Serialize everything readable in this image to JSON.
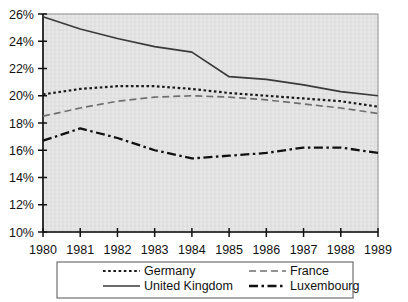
{
  "chart_data": {
    "type": "line",
    "title": "",
    "subtitle": "",
    "xlabel": "",
    "ylabel": "",
    "x": [
      1980,
      1981,
      1982,
      1983,
      1984,
      1985,
      1986,
      1987,
      1988,
      1989
    ],
    "xtick_labels": [
      "1980",
      "1981",
      "1982",
      "1983",
      "1984",
      "1985",
      "1986",
      "1987",
      "1988",
      "1989"
    ],
    "ytick_labels": [
      "10%",
      "12%",
      "14%",
      "16%",
      "18%",
      "20%",
      "22%",
      "24%",
      "26%"
    ],
    "ytick_values": [
      10,
      12,
      14,
      16,
      18,
      20,
      22,
      24,
      26
    ],
    "ylim": [
      10,
      26
    ],
    "xlim": [
      1980,
      1989
    ],
    "yunit": "%",
    "grid": true,
    "legend_position": "bottom",
    "plot_background": "#e8e8e8",
    "series": [
      {
        "name": "Germany",
        "dash": "dotted",
        "color": "#1a1a1a",
        "values": [
          20.1,
          20.5,
          20.7,
          20.7,
          20.5,
          20.2,
          20.0,
          19.8,
          19.6,
          19.2
        ]
      },
      {
        "name": "United Kingdom",
        "dash": "solid",
        "color": "#3a3a3a",
        "values": [
          25.8,
          24.9,
          24.2,
          23.6,
          23.2,
          21.4,
          21.2,
          20.8,
          20.3,
          20.0
        ]
      },
      {
        "name": "France",
        "dash": "longdash",
        "color": "#707070",
        "values": [
          18.5,
          19.1,
          19.6,
          19.9,
          20.0,
          19.9,
          19.7,
          19.4,
          19.1,
          18.7
        ]
      },
      {
        "name": "Luxembourg",
        "dash": "dashdot",
        "color": "#111111",
        "values": [
          16.7,
          17.6,
          16.9,
          16.0,
          15.4,
          15.6,
          15.8,
          16.2,
          16.2,
          15.8
        ]
      }
    ]
  },
  "legend": {
    "entries": [
      {
        "label": "Germany",
        "dash": "dotted"
      },
      {
        "label": "France",
        "dash": "longdash"
      },
      {
        "label": "United Kingdom",
        "dash": "solid"
      },
      {
        "label": "Luxembourg",
        "dash": "dashdot"
      }
    ]
  }
}
